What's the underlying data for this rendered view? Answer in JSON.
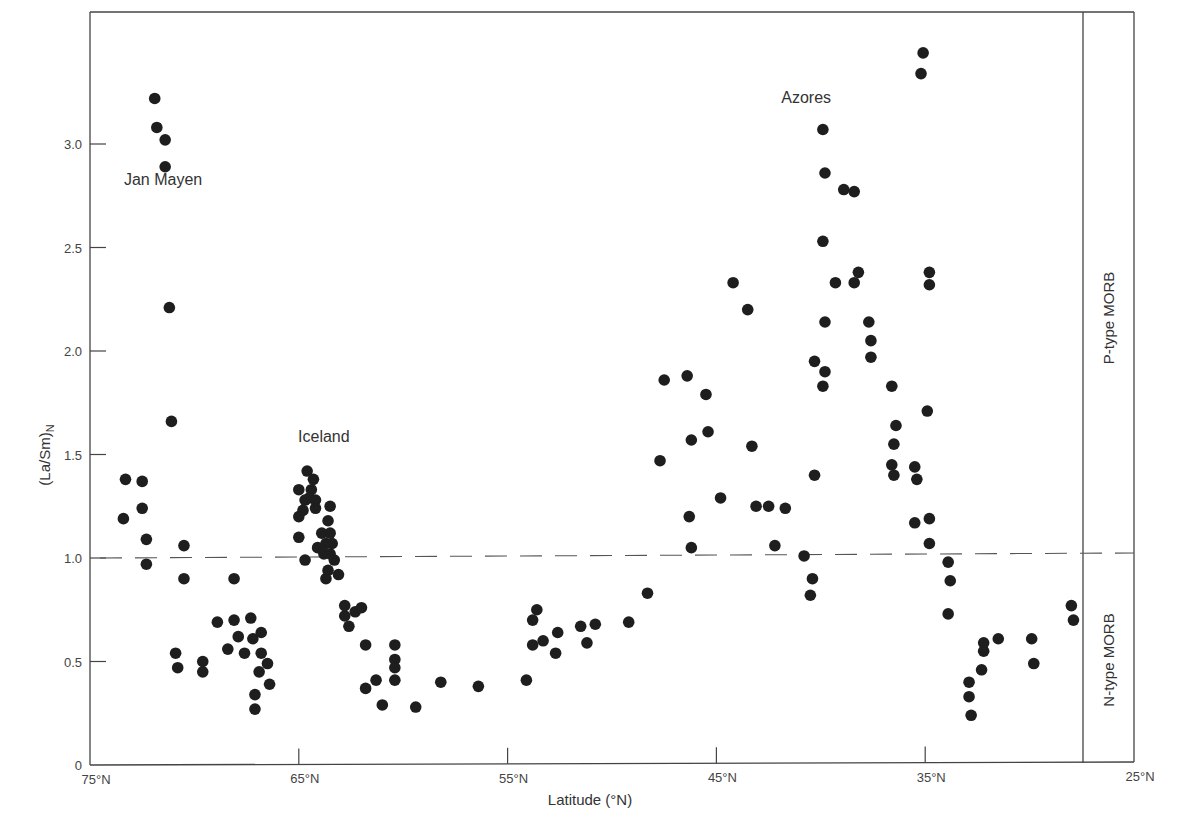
{
  "chart_data": {
    "type": "scatter",
    "title": "",
    "xlabel": "Latitude (°N)",
    "ylabel": "(La/Sm)N",
    "ylabel_main": "(La/Sm)",
    "ylabel_sub": "N",
    "xlim": [
      75,
      25
    ],
    "ylim": [
      0,
      3.45
    ],
    "x_ticks": [
      75,
      65,
      55,
      45,
      35,
      25
    ],
    "x_tick_labels": [
      "75°N",
      "65°N",
      "55°N",
      "45°N",
      "35°N",
      "25°N"
    ],
    "y_ticks": [
      0,
      0.5,
      1.0,
      1.5,
      2.0,
      2.5,
      3.0
    ],
    "y_tick_labels": [
      "0",
      "0.5",
      "1.0",
      "1.5",
      "2.0",
      "2.5",
      "3.0"
    ],
    "grid": false,
    "reference_line": {
      "y": 1.0,
      "style": "dashed"
    },
    "regions": [
      {
        "label": "P-type MORB",
        "y_range": [
          1.0,
          3.45
        ]
      },
      {
        "label": "N-type MORB",
        "y_range": [
          0,
          1.0
        ]
      }
    ],
    "annotations": [
      {
        "text": "Jan Mayen",
        "x": 71.5,
        "y": 2.8
      },
      {
        "text": "Iceland",
        "x": 63.8,
        "y": 1.56
      },
      {
        "text": "Azores",
        "x": 40.7,
        "y": 3.2
      }
    ],
    "series": [
      {
        "name": "MORB samples",
        "points": [
          [
            71.9,
            3.22
          ],
          [
            71.8,
            3.08
          ],
          [
            71.4,
            3.02
          ],
          [
            71.4,
            2.89
          ],
          [
            71.2,
            2.21
          ],
          [
            71.1,
            1.66
          ],
          [
            73.3,
            1.38
          ],
          [
            72.5,
            1.37
          ],
          [
            72.5,
            1.24
          ],
          [
            73.4,
            1.19
          ],
          [
            72.3,
            1.09
          ],
          [
            72.3,
            0.97
          ],
          [
            70.5,
            1.06
          ],
          [
            70.5,
            0.9
          ],
          [
            70.9,
            0.54
          ],
          [
            70.8,
            0.47
          ],
          [
            69.6,
            0.5
          ],
          [
            69.6,
            0.45
          ],
          [
            68.9,
            0.69
          ],
          [
            68.1,
            0.9
          ],
          [
            68.1,
            0.7
          ],
          [
            67.9,
            0.62
          ],
          [
            67.6,
            0.54
          ],
          [
            67.3,
            0.71
          ],
          [
            67.2,
            0.61
          ],
          [
            66.8,
            0.64
          ],
          [
            66.8,
            0.54
          ],
          [
            66.9,
            0.45
          ],
          [
            66.5,
            0.49
          ],
          [
            66.4,
            0.39
          ],
          [
            67.1,
            0.34
          ],
          [
            67.1,
            0.27
          ],
          [
            68.4,
            0.56
          ],
          [
            64.6,
            1.42
          ],
          [
            64.3,
            1.38
          ],
          [
            65.0,
            1.33
          ],
          [
            64.4,
            1.33
          ],
          [
            64.5,
            1.29
          ],
          [
            64.7,
            1.28
          ],
          [
            64.2,
            1.28
          ],
          [
            64.8,
            1.23
          ],
          [
            64.2,
            1.24
          ],
          [
            63.5,
            1.25
          ],
          [
            65.0,
            1.2
          ],
          [
            63.6,
            1.18
          ],
          [
            63.9,
            1.12
          ],
          [
            63.5,
            1.12
          ],
          [
            65.0,
            1.1
          ],
          [
            63.7,
            1.07
          ],
          [
            63.4,
            1.07
          ],
          [
            64.1,
            1.05
          ],
          [
            64.7,
            0.99
          ],
          [
            63.8,
            1.02
          ],
          [
            63.5,
            1.02
          ],
          [
            63.3,
            0.99
          ],
          [
            63.6,
            0.94
          ],
          [
            63.1,
            0.92
          ],
          [
            63.7,
            0.9
          ],
          [
            62.8,
            0.77
          ],
          [
            62.8,
            0.72
          ],
          [
            62.6,
            0.67
          ],
          [
            62.3,
            0.74
          ],
          [
            62.0,
            0.76
          ],
          [
            61.8,
            0.58
          ],
          [
            60.4,
            0.58
          ],
          [
            60.4,
            0.51
          ],
          [
            60.4,
            0.47
          ],
          [
            60.4,
            0.41
          ],
          [
            61.8,
            0.37
          ],
          [
            61.3,
            0.41
          ],
          [
            61.0,
            0.29
          ],
          [
            59.4,
            0.28
          ],
          [
            58.2,
            0.4
          ],
          [
            56.4,
            0.38
          ],
          [
            54.1,
            0.41
          ],
          [
            53.8,
            0.7
          ],
          [
            53.6,
            0.75
          ],
          [
            53.8,
            0.58
          ],
          [
            53.3,
            0.6
          ],
          [
            52.7,
            0.54
          ],
          [
            52.6,
            0.64
          ],
          [
            51.5,
            0.67
          ],
          [
            51.2,
            0.59
          ],
          [
            50.8,
            0.68
          ],
          [
            49.2,
            0.69
          ],
          [
            48.3,
            0.83
          ],
          [
            47.7,
            1.47
          ],
          [
            47.5,
            1.86
          ],
          [
            46.4,
            1.88
          ],
          [
            46.2,
            1.57
          ],
          [
            45.5,
            1.79
          ],
          [
            45.4,
            1.61
          ],
          [
            46.3,
            1.2
          ],
          [
            46.2,
            1.05
          ],
          [
            44.8,
            1.29
          ],
          [
            44.2,
            2.33
          ],
          [
            43.5,
            2.2
          ],
          [
            43.3,
            1.54
          ],
          [
            43.1,
            1.25
          ],
          [
            42.5,
            1.25
          ],
          [
            41.7,
            1.24
          ],
          [
            42.2,
            1.06
          ],
          [
            40.8,
            1.01
          ],
          [
            40.4,
            0.9
          ],
          [
            40.5,
            0.82
          ],
          [
            40.3,
            1.95
          ],
          [
            40.3,
            1.4
          ],
          [
            39.9,
            3.07
          ],
          [
            39.8,
            2.86
          ],
          [
            39.9,
            2.53
          ],
          [
            39.8,
            2.14
          ],
          [
            39.8,
            1.9
          ],
          [
            39.9,
            1.83
          ],
          [
            39.3,
            2.33
          ],
          [
            38.9,
            2.78
          ],
          [
            38.4,
            2.77
          ],
          [
            38.4,
            2.33
          ],
          [
            38.2,
            2.38
          ],
          [
            37.7,
            2.14
          ],
          [
            37.6,
            2.05
          ],
          [
            37.6,
            1.97
          ],
          [
            36.6,
            1.83
          ],
          [
            36.5,
            1.55
          ],
          [
            36.4,
            1.64
          ],
          [
            36.6,
            1.45
          ],
          [
            36.5,
            1.4
          ],
          [
            35.5,
            1.44
          ],
          [
            35.4,
            1.38
          ],
          [
            35.5,
            1.17
          ],
          [
            35.1,
            3.44
          ],
          [
            35.2,
            3.34
          ],
          [
            34.8,
            2.38
          ],
          [
            34.8,
            2.32
          ],
          [
            34.9,
            1.71
          ],
          [
            34.8,
            1.19
          ],
          [
            34.8,
            1.07
          ],
          [
            33.9,
            0.98
          ],
          [
            33.8,
            0.89
          ],
          [
            33.9,
            0.73
          ],
          [
            32.9,
            0.4
          ],
          [
            32.9,
            0.33
          ],
          [
            32.8,
            0.24
          ],
          [
            32.2,
            0.59
          ],
          [
            32.2,
            0.55
          ],
          [
            32.3,
            0.46
          ],
          [
            31.5,
            0.61
          ],
          [
            29.9,
            0.61
          ],
          [
            29.8,
            0.49
          ],
          [
            28.0,
            0.77
          ],
          [
            27.9,
            0.7
          ]
        ]
      }
    ]
  }
}
